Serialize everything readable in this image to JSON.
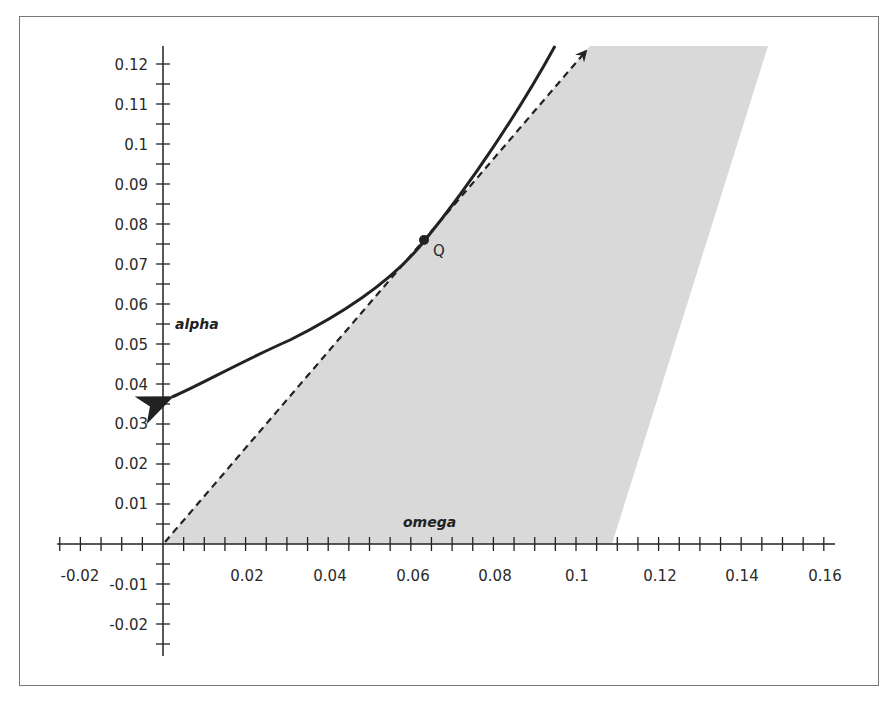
{
  "chart_data": {
    "type": "line",
    "title": "",
    "xlabel": "omega",
    "ylabel": "alpha",
    "xlim": [
      -0.025,
      0.16
    ],
    "ylim": [
      -0.03,
      0.125
    ],
    "grid": false,
    "x_ticks": [
      "-0.02",
      "0.02",
      "0.04",
      "0.06",
      "0.08",
      "0.1",
      "0.12",
      "0.14",
      "0.16"
    ],
    "y_ticks": [
      "0.12",
      "0.11",
      "0.1",
      "0.09",
      "0.08",
      "0.07",
      "0.06",
      "0.05",
      "0.04",
      "0.03",
      "0.02",
      "0.01",
      "-0.01",
      "-0.02"
    ],
    "series": [
      {
        "name": "curve",
        "style": "solid",
        "points": [
          [
            0.0,
            0.037
          ],
          [
            0.02,
            0.043
          ],
          [
            0.04,
            0.055
          ],
          [
            0.05,
            0.061
          ],
          [
            0.0635,
            0.076
          ],
          [
            0.075,
            0.09
          ],
          [
            0.085,
            0.107
          ],
          [
            0.095,
            0.125
          ]
        ]
      },
      {
        "name": "tangent",
        "style": "dashed",
        "points": [
          [
            0.0,
            0.0
          ],
          [
            0.1035,
            0.1245
          ]
        ]
      }
    ],
    "shaded_region": {
      "name": "feasible region",
      "vertices": [
        [
          0.0,
          0.0
        ],
        [
          0.1035,
          0.1245
        ],
        [
          0.1466,
          0.1245
        ],
        [
          0.1088,
          0.0
        ]
      ],
      "color": "#d9d9d9"
    },
    "annotations": [
      {
        "text": "Q",
        "x": 0.0635,
        "y": 0.076
      },
      {
        "text": "alpha",
        "x": 0.003,
        "y": 0.054
      },
      {
        "text": "omega",
        "x": 0.058,
        "y": 0.006
      }
    ]
  },
  "labels": {
    "point": "Q",
    "y_axis_name": "alpha",
    "x_axis_name": "omega",
    "x_ticks": [
      "-0.02",
      "0.02",
      "0.04",
      "0.06",
      "0.08",
      "0.1",
      "0.12",
      "0.14",
      "0.16"
    ],
    "y_ticks": [
      "0.12",
      "0.11",
      "0.1",
      "0.09",
      "0.08",
      "0.07",
      "0.06",
      "0.05",
      "0.04",
      "0.03",
      "0.02",
      "0.01",
      "-0.01",
      "-0.02"
    ]
  },
  "colors": {
    "shade": "#d9d9d9",
    "ink": "#222222",
    "frame": "#777777"
  }
}
